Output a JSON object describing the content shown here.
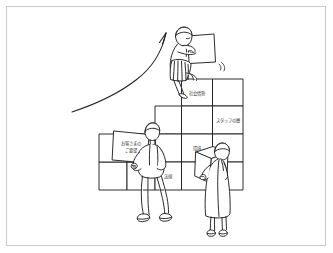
{
  "illustration": {
    "title": "Team building a staircase of blocks with upward growth arrow",
    "style": "hand-drawn line art",
    "line_color": "#222222",
    "frame_color": "#c9c9c9",
    "background_color": "#ffffff"
  },
  "arrow": {
    "name": "growth-arrow",
    "direction": "upward-right",
    "label": ""
  },
  "blocks": [
    {
      "id": "block-top-label",
      "label": "社会情勢",
      "lines": [
        "社会情勢"
      ]
    },
    {
      "id": "block-staff-layer",
      "label": "スタッフの層",
      "lines": [
        "スタッフの層"
      ]
    },
    {
      "id": "block-kankyo",
      "label": "環境",
      "lines": [
        "環境"
      ]
    },
    {
      "id": "block-hoki",
      "label": "法規",
      "lines": [
        "法規"
      ]
    },
    {
      "id": "block-blank-1",
      "label": "",
      "lines": []
    },
    {
      "id": "block-blank-2",
      "label": "",
      "lines": []
    },
    {
      "id": "block-blank-3",
      "label": "",
      "lines": []
    },
    {
      "id": "block-blank-4",
      "label": "",
      "lines": []
    },
    {
      "id": "block-blank-5",
      "label": "",
      "lines": []
    },
    {
      "id": "block-blank-6",
      "label": "",
      "lines": []
    },
    {
      "id": "block-blank-7",
      "label": "",
      "lines": []
    },
    {
      "id": "block-blank-8",
      "label": "",
      "lines": []
    },
    {
      "id": "block-blank-9",
      "label": "",
      "lines": []
    },
    {
      "id": "block-blank-10",
      "label": "",
      "lines": []
    }
  ],
  "carried_boxes": [
    {
      "id": "box-customer-request",
      "carried_by": "figure-walking-man",
      "line1": "お客さまの",
      "line2": "ご要望"
    },
    {
      "id": "box-top-blank",
      "carried_by": "figure-top-woman",
      "line1": "",
      "line2": ""
    },
    {
      "id": "box-right-blank",
      "carried_by": "figure-right-woman",
      "line1": "",
      "line2": ""
    }
  ],
  "figures": [
    {
      "id": "figure-top-woman",
      "name": "person-placing-block-top",
      "pose": "kneeling on top step, holding a box"
    },
    {
      "id": "figure-walking-man",
      "name": "person-carrying-box-left",
      "pose": "walking, carrying labeled box"
    },
    {
      "id": "figure-right-woman",
      "name": "person-carrying-box-right",
      "pose": "standing, carrying box"
    }
  ]
}
